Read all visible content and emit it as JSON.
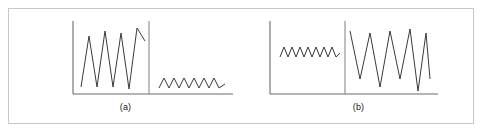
{
  "figure": {
    "background_color": "#ffffff",
    "frame_color": "#c8c8c8",
    "axis_color": "#6b6b6b",
    "divider_color": "#8a8a8a",
    "signal_color": "#3a3a3a",
    "width": 484,
    "height": 133
  },
  "panels": [
    {
      "id": "a",
      "caption": "(a)",
      "axes": {
        "y_axis_x": 64,
        "x_axis_y": 85,
        "x_axis_x_start": 64,
        "x_axis_x_end": 224,
        "y_axis_y_top": 12,
        "divider_x": 140,
        "divider_y_top": 12,
        "divider_y_bottom": 85
      },
      "segments": [
        {
          "name": "high-amplitude-segment",
          "position": "left",
          "description": "Large amplitude oscillation before transition",
          "peak_count": 4,
          "amplitude": "large",
          "x_start": 72,
          "x_end": 136,
          "y_top": 19,
          "y_bottom": 78,
          "baseline_y": 48,
          "points": "72,78 80,27 88,78 96,22 104,78 112,24 120,80 128,19 136,32"
        },
        {
          "name": "low-amplitude-segment",
          "position": "right",
          "description": "Small amplitude oscillation after transition",
          "peak_count": 7,
          "amplitude": "small",
          "x_start": 150,
          "x_end": 216,
          "y_top": 69,
          "y_bottom": 79,
          "baseline_y": 74,
          "points": "150,79 155,69 160,79 165,69 170,79 175,69 180,79 185,69 190,79 195,69 200,79 205,69 210,79 216,75"
        }
      ]
    },
    {
      "id": "b",
      "caption": "(b)",
      "axes": {
        "y_axis_x": 28,
        "x_axis_y": 85,
        "x_axis_x_start": 28,
        "x_axis_x_end": 196,
        "y_axis_y_top": 12,
        "divider_x": 103,
        "divider_y_top": 12,
        "divider_y_bottom": 85
      },
      "segments": [
        {
          "name": "low-amplitude-segment",
          "position": "left",
          "description": "Small amplitude oscillation before transition",
          "peak_count": 7,
          "amplitude": "small",
          "x_start": 38,
          "x_end": 98,
          "y_top": 38,
          "y_bottom": 48,
          "baseline_y": 43,
          "points": "38,48 42,38 46,48 50,38 54,48 58,38 62,48 66,38 70,48 74,38 78,48 82,38 86,48 90,38 94,48 98,44"
        },
        {
          "name": "high-amplitude-segment",
          "position": "right",
          "description": "Large amplitude oscillation after transition",
          "peak_count": 4,
          "amplitude": "large",
          "x_start": 108,
          "x_end": 188,
          "y_top": 20,
          "y_bottom": 82,
          "baseline_y": 50,
          "points": "108,22 118,70 128,24 138,78 148,22 158,70 168,20 176,82 184,24 188,70"
        }
      ]
    }
  ]
}
